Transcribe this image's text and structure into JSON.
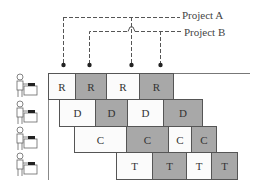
{
  "legend": {
    "project_a": "Project A",
    "project_b": "Project B"
  },
  "colors": {
    "project_a_fill": "#fbfbfb",
    "project_b_fill": "#a8a8a8",
    "border": "#555555",
    "dash": "#555555"
  },
  "milestones": [
    {
      "project": "Project A",
      "x": 63
    },
    {
      "project": "Project B",
      "x": 89
    },
    {
      "project": "Project A",
      "x": 131
    },
    {
      "project": "Project B",
      "x": 160
    }
  ],
  "rows": [
    {
      "worker": "worker-1",
      "cells": [
        {
          "label": "R",
          "project": "A",
          "x": 48,
          "w": 27
        },
        {
          "label": "R",
          "project": "B",
          "x": 75,
          "w": 31
        },
        {
          "label": "R",
          "project": "A",
          "x": 106,
          "w": 33
        },
        {
          "label": "R",
          "project": "B",
          "x": 139,
          "w": 34
        }
      ]
    },
    {
      "worker": "worker-2",
      "cells": [
        {
          "label": "D",
          "project": "A",
          "x": 59,
          "w": 36
        },
        {
          "label": "D",
          "project": "B",
          "x": 95,
          "w": 32
        },
        {
          "label": "D",
          "project": "A",
          "x": 127,
          "w": 36
        },
        {
          "label": "D",
          "project": "B",
          "x": 163,
          "w": 39
        }
      ]
    },
    {
      "worker": "worker-3",
      "cells": [
        {
          "label": "C",
          "project": "A",
          "x": 74,
          "w": 52
        },
        {
          "label": "C",
          "project": "B",
          "x": 126,
          "w": 42
        },
        {
          "label": "C",
          "project": "A",
          "x": 168,
          "w": 23
        },
        {
          "label": "C",
          "project": "B",
          "x": 191,
          "w": 25
        }
      ]
    },
    {
      "worker": "worker-4",
      "cells": [
        {
          "label": "T",
          "project": "A",
          "x": 116,
          "w": 36
        },
        {
          "label": "T",
          "project": "B",
          "x": 152,
          "w": 34
        },
        {
          "label": "T",
          "project": "A",
          "x": 186,
          "w": 25
        },
        {
          "label": "T",
          "project": "B",
          "x": 211,
          "w": 26
        }
      ]
    }
  ]
}
